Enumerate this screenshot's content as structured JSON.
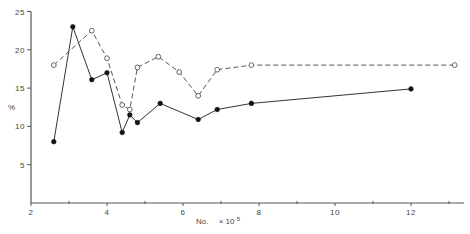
{
  "chart_data": {
    "type": "line",
    "title": "",
    "xlabel": "No.",
    "xlabel_multiplier": "× 10",
    "xlabel_exponent": "5",
    "ylabel": "%",
    "xlim": [
      2,
      13.4
    ],
    "ylim": [
      0,
      25
    ],
    "x_major_ticks": [
      2,
      4,
      6,
      8,
      10,
      12
    ],
    "x_minor_ticks": [
      3,
      5,
      7,
      9,
      11,
      13
    ],
    "y_ticks": [
      5,
      10,
      15,
      20,
      25
    ],
    "grid": false,
    "legend": null,
    "series": [
      {
        "name": "filled",
        "marker": "filled-circle",
        "line": "solid",
        "points": [
          [
            2.6,
            8.0
          ],
          [
            3.1,
            23.0
          ],
          [
            3.6,
            16.1
          ],
          [
            4.0,
            17.0
          ],
          [
            4.4,
            9.2
          ],
          [
            4.6,
            11.5
          ],
          [
            4.8,
            10.5
          ],
          [
            5.4,
            13.0
          ],
          [
            6.4,
            10.9
          ],
          [
            6.9,
            12.2
          ],
          [
            7.8,
            13.0
          ],
          [
            12.0,
            14.9
          ]
        ]
      },
      {
        "name": "open",
        "marker": "open-circle",
        "line": "dashed",
        "points": [
          [
            2.6,
            18.0
          ],
          [
            3.6,
            22.5
          ],
          [
            4.0,
            18.9
          ],
          [
            4.4,
            12.8
          ],
          [
            4.6,
            12.2
          ],
          [
            4.8,
            17.7
          ],
          [
            5.35,
            19.1
          ],
          [
            5.9,
            17.1
          ],
          [
            6.4,
            14.0
          ],
          [
            6.9,
            17.4
          ],
          [
            7.8,
            18.0
          ],
          [
            13.15,
            18.0
          ]
        ]
      }
    ]
  }
}
